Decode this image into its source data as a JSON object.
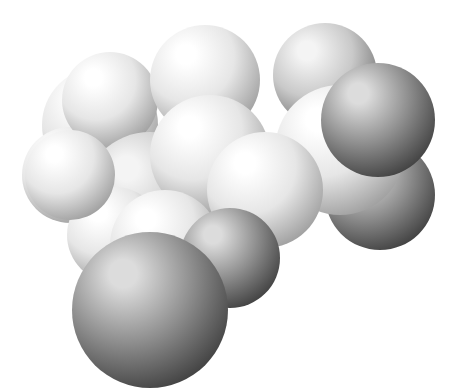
{
  "figure": {
    "caption": "",
    "background": "#ffffff",
    "width": 456,
    "height": 389
  },
  "palette": {
    "light": {
      "highlight": "#ffffff",
      "mid": "#e6e6e6",
      "shadow": "#9a9a9a"
    },
    "medium": {
      "highlight": "#f4f4f4",
      "mid": "#c9c9c9",
      "shadow": "#6f6f6f"
    },
    "dark": {
      "highlight": "#dcdcdc",
      "mid": "#8f8f8f",
      "shadow": "#3c3c3c"
    }
  },
  "atoms": [
    {
      "id": "a1",
      "cx": 100,
      "cy": 125,
      "r": 58,
      "tone": "light",
      "label": "back-left-atom"
    },
    {
      "id": "a2",
      "cx": 70,
      "cy": 175,
      "r": 48,
      "tone": "light",
      "label": "left-atom"
    },
    {
      "id": "a3",
      "cx": 110,
      "cy": 100,
      "r": 48,
      "tone": "light",
      "label": "upper-left-atom"
    },
    {
      "id": "a4",
      "cx": 205,
      "cy": 80,
      "r": 55,
      "tone": "light",
      "label": "top-center-atom"
    },
    {
      "id": "a5",
      "cx": 325,
      "cy": 75,
      "r": 52,
      "tone": "medium",
      "label": "top-right-atom"
    },
    {
      "id": "a6",
      "cx": 380,
      "cy": 195,
      "r": 55,
      "tone": "dark",
      "label": "right-lower-atom"
    },
    {
      "id": "a7",
      "cx": 150,
      "cy": 200,
      "r": 68,
      "tone": "medium",
      "label": "center-left-carbon"
    },
    {
      "id": "a8",
      "cx": 210,
      "cy": 155,
      "r": 60,
      "tone": "light",
      "label": "center-carbon"
    },
    {
      "id": "a9",
      "cx": 340,
      "cy": 150,
      "r": 65,
      "tone": "light",
      "label": "right-center-atom"
    },
    {
      "id": "a10",
      "cx": 265,
      "cy": 190,
      "r": 58,
      "tone": "light",
      "label": "center-right-atom"
    },
    {
      "id": "a11",
      "cx": 115,
      "cy": 235,
      "r": 48,
      "tone": "light",
      "label": "lower-left-atom"
    },
    {
      "id": "a12",
      "cx": 70,
      "cy": 175,
      "r": 45,
      "tone": "light",
      "label": "left-front-atom"
    },
    {
      "id": "a13",
      "cx": 165,
      "cy": 245,
      "r": 55,
      "tone": "light",
      "label": "lower-center-atom"
    },
    {
      "id": "a14",
      "cx": 378,
      "cy": 120,
      "r": 57,
      "tone": "dark",
      "label": "right-front-atom"
    },
    {
      "id": "a15",
      "cx": 230,
      "cy": 258,
      "r": 50,
      "tone": "dark",
      "label": "lower-front-atom"
    },
    {
      "id": "a16",
      "cx": 150,
      "cy": 310,
      "r": 78,
      "tone": "dark",
      "label": "bottom-front-atom"
    }
  ]
}
